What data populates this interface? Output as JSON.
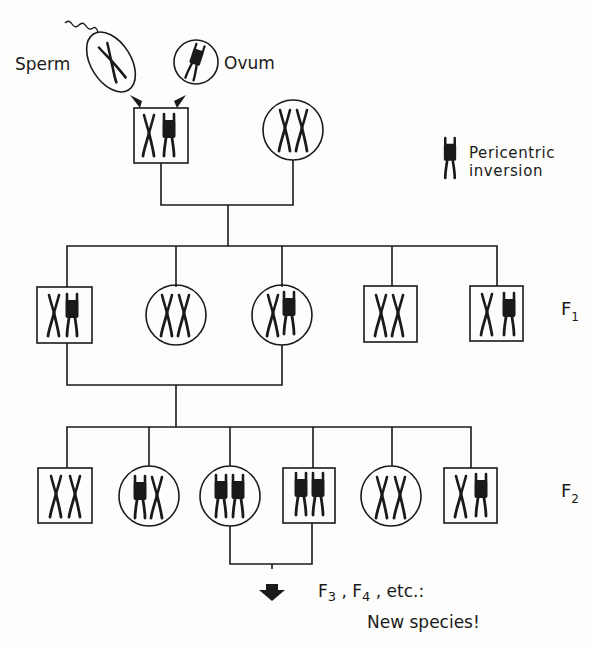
{
  "labels": {
    "sperm": "Sperm",
    "ovum": "Ovum",
    "legend_line1": "Pericentric",
    "legend_line2": "inversion",
    "f1_letter": "F",
    "f1_sub": "1",
    "f2_letter": "F",
    "f2_sub": "2",
    "f3_letter": "F",
    "f3_sub": "3",
    "f4_letter": "F",
    "f4_sub": "4",
    "comma": ",",
    "etc": "etc.:",
    "conclusion": "New species!"
  },
  "legend": {
    "icon": "inverted-chromosome-icon",
    "meaning": "Pericentric inversion"
  },
  "colors": {
    "ink": "#1a1a1a",
    "background": "#fdfdfb"
  },
  "gametes": [
    {
      "type": "sperm",
      "shape": "ellipse",
      "chromosome": "normal"
    },
    {
      "type": "ovum",
      "shape": "circle",
      "chromosome": "inverted"
    }
  ],
  "generations": {
    "P": [
      {
        "sex": "male",
        "shape": "square",
        "chromosomes": [
          "normal",
          "inverted"
        ]
      },
      {
        "sex": "female",
        "shape": "circle",
        "chromosomes": [
          "normal",
          "normal"
        ]
      }
    ],
    "F1": [
      {
        "sex": "male",
        "shape": "square",
        "chromosomes": [
          "normal",
          "inverted"
        ]
      },
      {
        "sex": "female",
        "shape": "circle",
        "chromosomes": [
          "normal",
          "normal"
        ]
      },
      {
        "sex": "female",
        "shape": "circle",
        "chromosomes": [
          "normal",
          "inverted"
        ]
      },
      {
        "sex": "male",
        "shape": "square",
        "chromosomes": [
          "normal",
          "normal"
        ]
      },
      {
        "sex": "male",
        "shape": "square",
        "chromosomes": [
          "normal",
          "inverted"
        ]
      }
    ],
    "F2": [
      {
        "sex": "male",
        "shape": "square",
        "chromosomes": [
          "normal",
          "normal"
        ]
      },
      {
        "sex": "female",
        "shape": "circle",
        "chromosomes": [
          "inverted",
          "normal"
        ]
      },
      {
        "sex": "female",
        "shape": "circle",
        "chromosomes": [
          "inverted",
          "inverted"
        ]
      },
      {
        "sex": "male",
        "shape": "square",
        "chromosomes": [
          "inverted",
          "inverted"
        ]
      },
      {
        "sex": "female",
        "shape": "circle",
        "chromosomes": [
          "normal",
          "normal"
        ]
      },
      {
        "sex": "male",
        "shape": "square",
        "chromosomes": [
          "normal",
          "inverted"
        ]
      }
    ]
  }
}
